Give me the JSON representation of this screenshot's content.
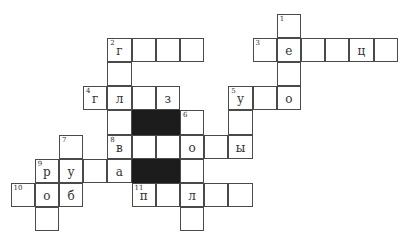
{
  "crossword": {
    "cells": [
      {
        "r": 0,
        "c": 11,
        "num": "1",
        "letter": ""
      },
      {
        "r": 1,
        "c": 4,
        "num": "2",
        "letter": "г"
      },
      {
        "r": 1,
        "c": 5,
        "num": "",
        "letter": ""
      },
      {
        "r": 1,
        "c": 6,
        "num": "",
        "letter": ""
      },
      {
        "r": 1,
        "c": 7,
        "num": "",
        "letter": ""
      },
      {
        "r": 1,
        "c": 10,
        "num": "3",
        "letter": ""
      },
      {
        "r": 1,
        "c": 11,
        "num": "",
        "letter": "е"
      },
      {
        "r": 1,
        "c": 12,
        "num": "",
        "letter": ""
      },
      {
        "r": 1,
        "c": 13,
        "num": "",
        "letter": ""
      },
      {
        "r": 1,
        "c": 14,
        "num": "",
        "letter": "ц"
      },
      {
        "r": 1,
        "c": 15,
        "num": "",
        "letter": ""
      },
      {
        "r": 2,
        "c": 4,
        "num": "",
        "letter": ""
      },
      {
        "r": 2,
        "c": 11,
        "num": "",
        "letter": ""
      },
      {
        "r": 3,
        "c": 3,
        "num": "4",
        "letter": "г"
      },
      {
        "r": 3,
        "c": 4,
        "num": "",
        "letter": "л"
      },
      {
        "r": 3,
        "c": 5,
        "num": "",
        "letter": ""
      },
      {
        "r": 3,
        "c": 6,
        "num": "",
        "letter": "з"
      },
      {
        "r": 3,
        "c": 9,
        "num": "5",
        "letter": "у"
      },
      {
        "r": 3,
        "c": 10,
        "num": "",
        "letter": ""
      },
      {
        "r": 3,
        "c": 11,
        "num": "",
        "letter": "о"
      },
      {
        "r": 4,
        "c": 4,
        "num": "",
        "letter": ""
      },
      {
        "r": 4,
        "c": 5,
        "num": "",
        "letter": "",
        "black": true
      },
      {
        "r": 4,
        "c": 6,
        "num": "",
        "letter": "",
        "black": true
      },
      {
        "r": 4,
        "c": 7,
        "num": "6",
        "letter": ""
      },
      {
        "r": 4,
        "c": 9,
        "num": "",
        "letter": ""
      },
      {
        "r": 5,
        "c": 2,
        "num": "7",
        "letter": ""
      },
      {
        "r": 5,
        "c": 4,
        "num": "8",
        "letter": "в"
      },
      {
        "r": 5,
        "c": 5,
        "num": "",
        "letter": ""
      },
      {
        "r": 5,
        "c": 6,
        "num": "",
        "letter": ""
      },
      {
        "r": 5,
        "c": 7,
        "num": "",
        "letter": "о"
      },
      {
        "r": 5,
        "c": 8,
        "num": "",
        "letter": ""
      },
      {
        "r": 5,
        "c": 9,
        "num": "",
        "letter": "ы"
      },
      {
        "r": 6,
        "c": 1,
        "num": "9",
        "letter": "р"
      },
      {
        "r": 6,
        "c": 2,
        "num": "",
        "letter": "у"
      },
      {
        "r": 6,
        "c": 3,
        "num": "",
        "letter": ""
      },
      {
        "r": 6,
        "c": 4,
        "num": "",
        "letter": "а"
      },
      {
        "r": 6,
        "c": 5,
        "num": "",
        "letter": "",
        "black": true
      },
      {
        "r": 6,
        "c": 6,
        "num": "",
        "letter": "",
        "black": true
      },
      {
        "r": 6,
        "c": 7,
        "num": "",
        "letter": ""
      },
      {
        "r": 7,
        "c": 0,
        "num": "10",
        "letter": ""
      },
      {
        "r": 7,
        "c": 1,
        "num": "",
        "letter": "о"
      },
      {
        "r": 7,
        "c": 2,
        "num": "",
        "letter": "б"
      },
      {
        "r": 7,
        "c": 5,
        "num": "11",
        "letter": "п"
      },
      {
        "r": 7,
        "c": 6,
        "num": "",
        "letter": ""
      },
      {
        "r": 7,
        "c": 7,
        "num": "",
        "letter": "л"
      },
      {
        "r": 7,
        "c": 8,
        "num": "",
        "letter": ""
      },
      {
        "r": 7,
        "c": 9,
        "num": "",
        "letter": ""
      },
      {
        "r": 8,
        "c": 1,
        "num": "",
        "letter": ""
      },
      {
        "r": 8,
        "c": 7,
        "num": "",
        "letter": ""
      }
    ]
  }
}
